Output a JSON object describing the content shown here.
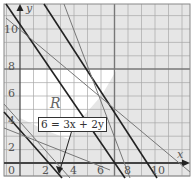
{
  "axes": {
    "x_label": "x",
    "y_label": "y",
    "x_ticks": [
      "0",
      "2",
      "4",
      "6",
      "8",
      "10"
    ],
    "y_ticks": [
      "2",
      "4",
      "6",
      "8",
      "10"
    ]
  },
  "region_label": "R",
  "equation_label": "6 = 3x + 2y",
  "colors": {
    "shade": "#e4e4e4",
    "grid": "#9a9a9a",
    "thick": "#222222",
    "thin": "#777777"
  }
}
